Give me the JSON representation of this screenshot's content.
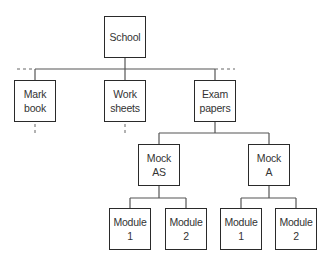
{
  "diagram": {
    "type": "hierarchy-tree",
    "nodes": {
      "root": {
        "label": "School"
      },
      "mark_book": {
        "label": "Mark\nbook"
      },
      "worksheets": {
        "label": "Work\nsheets"
      },
      "exam_papers": {
        "label": "Exam\npapers"
      },
      "mock_as": {
        "label": "Mock\nAS"
      },
      "mock_a": {
        "label": "Mock\nA"
      },
      "mock_as_module_1": {
        "label": "Module\n1"
      },
      "mock_as_module_2": {
        "label": "Module\n2"
      },
      "mock_a_module_1": {
        "label": "Module\n1"
      },
      "mock_a_module_2": {
        "label": "Module\n2"
      }
    },
    "edges": [
      [
        "root",
        "mark_book"
      ],
      [
        "root",
        "worksheets"
      ],
      [
        "root",
        "exam_papers"
      ],
      [
        "exam_papers",
        "mock_as"
      ],
      [
        "exam_papers",
        "mock_a"
      ],
      [
        "mock_as",
        "mock_as_module_1"
      ],
      [
        "mock_as",
        "mock_as_module_2"
      ],
      [
        "mock_a",
        "mock_a_module_1"
      ],
      [
        "mock_a",
        "mock_a_module_2"
      ]
    ],
    "continuations": {
      "siblings_left_dashed": true,
      "siblings_right_dashed": true,
      "mark_book_children_dashed": true,
      "worksheets_children_dashed": true
    },
    "colors": {
      "box_border": "#2a2a2a",
      "connector": "#555555",
      "text": "#333333"
    }
  }
}
